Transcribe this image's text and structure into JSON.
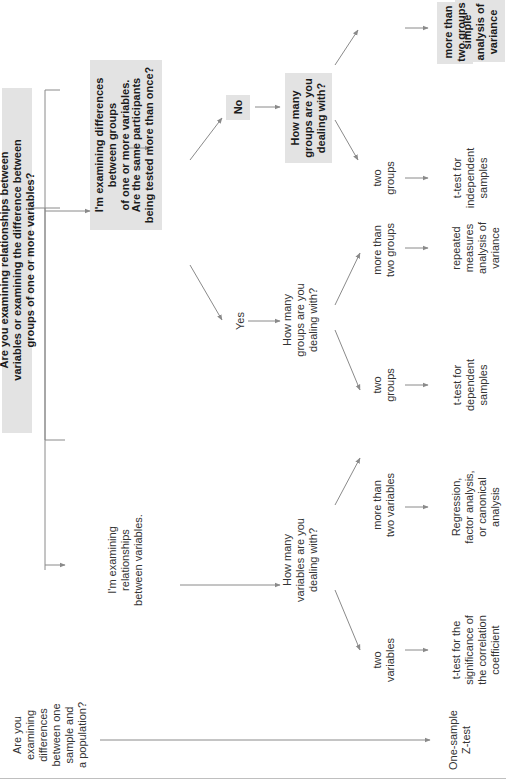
{
  "diagram": {
    "orientation": "rotated-90-ccw",
    "colors": {
      "box_fill": "#e3e3e3",
      "line": "#8a8a8a",
      "text": "#333333",
      "bold_text": "#1a1a1a",
      "background": "#ffffff"
    },
    "nodes": {
      "root": {
        "lines": [
          "Are you examining relationships between",
          "variables or examining the difference between",
          "groups of one or more variables?"
        ],
        "bold": true,
        "boxed": true
      },
      "one_sample_q": {
        "lines": [
          "Are you",
          "examining",
          "differences",
          "between one",
          "sample and",
          "a population?"
        ],
        "bold": false,
        "boxed": false
      },
      "relationships": {
        "lines": [
          "I'm examining",
          "relationships",
          "between variables."
        ],
        "bold": false,
        "boxed": false
      },
      "differences": {
        "lines": [
          "I'm examining differences",
          "between groups",
          "of one or more variables."
        ],
        "bold": true,
        "boxed": true
      },
      "same_participants": {
        "lines": [
          "Are the same participants",
          "being tested more than once?"
        ],
        "bold": true,
        "boxed": true
      },
      "yes": {
        "lines": [
          "Yes"
        ],
        "bold": false,
        "boxed": false
      },
      "no": {
        "lines": [
          "No"
        ],
        "bold": true,
        "boxed": true
      },
      "how_many_vars": {
        "lines": [
          "How many",
          "variables are you",
          "dealing with?"
        ],
        "bold": false,
        "boxed": false
      },
      "how_many_groups_yes": {
        "lines": [
          "How many",
          "groups are you",
          "dealing with?"
        ],
        "bold": false,
        "boxed": false
      },
      "how_many_groups_no": {
        "lines": [
          "How many",
          "groups are you",
          "dealing with?"
        ],
        "bold": true,
        "boxed": true
      },
      "two_variables": {
        "lines": [
          "two",
          "variables"
        ],
        "bold": false,
        "boxed": false
      },
      "more_than_two_variables": {
        "lines": [
          "more than",
          "two variables"
        ],
        "bold": false,
        "boxed": false
      },
      "two_groups_dep": {
        "lines": [
          "two",
          "groups"
        ],
        "bold": false,
        "boxed": false
      },
      "more_than_two_groups_rep": {
        "lines": [
          "more than",
          "two groups"
        ],
        "bold": false,
        "boxed": false
      },
      "two_groups_ind": {
        "lines": [
          "two",
          "groups"
        ],
        "bold": false,
        "boxed": false
      },
      "more_than_two_groups_simple": {
        "lines": [
          "more than",
          "two groups"
        ],
        "bold": true,
        "boxed": true
      },
      "one_sample_z": {
        "lines": [
          "One-sample",
          "Z-test"
        ],
        "bold": false,
        "boxed": false
      },
      "t_corr": {
        "lines": [
          "t-test for the",
          "significance of",
          "the correlation",
          "coefficient"
        ],
        "bold": false,
        "boxed": false
      },
      "regression": {
        "lines": [
          "Regression,",
          "factor analysis,",
          "or canonical",
          "analysis"
        ],
        "bold": false,
        "boxed": false
      },
      "t_dependent": {
        "lines": [
          "t-test for",
          "dependent",
          "samples"
        ],
        "bold": false,
        "boxed": false
      },
      "repeated_anova": {
        "lines": [
          "repeated",
          "measures",
          "analysis of",
          "variance"
        ],
        "bold": false,
        "boxed": false
      },
      "t_independent": {
        "lines": [
          "t-test for",
          "independent",
          "samples"
        ],
        "bold": false,
        "boxed": false
      },
      "simple_anova": {
        "lines": [
          "simple",
          "analysis of",
          "variance"
        ],
        "bold": true,
        "boxed": true
      }
    }
  }
}
